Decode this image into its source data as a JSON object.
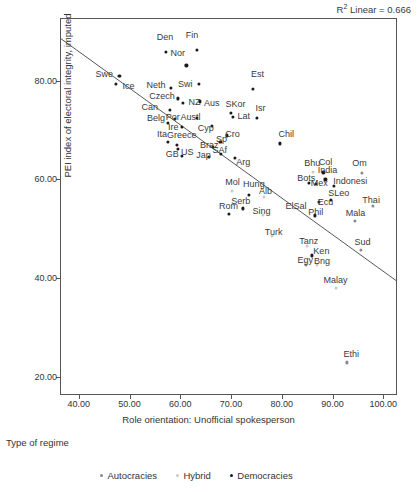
{
  "annotation": {
    "r2_prefix": "R",
    "r2_sup": "2",
    "r2_text": " Linear = 0.666"
  },
  "axes": {
    "ylabel": "PEI index of electoral integrity, imputed",
    "xlabel": "Role orientation: Unofficial spokesperson",
    "yticks": [
      "20.00",
      "40.00",
      "60.00",
      "80.00"
    ],
    "xticks": [
      "40.00",
      "50.00",
      "60.00",
      "70.00",
      "80.00",
      "90.00",
      "100.00"
    ]
  },
  "legend": {
    "title": "Type of regime",
    "items": [
      {
        "label": "Autocracies",
        "color": "#8a8a8a"
      },
      {
        "label": "Hybrid",
        "color": "#c9c9c9"
      },
      {
        "label": "Democracies",
        "color": "#1a1a1a"
      }
    ]
  },
  "chart_data": {
    "type": "scatter",
    "title": "",
    "xlabel": "Role orientation: Unofficial spokesperson",
    "ylabel": "PEI index of electoral integrity, imputed",
    "xlim": [
      36.5,
      102.5
    ],
    "ylim": [
      16.5,
      92.5
    ],
    "grid": false,
    "legend_position": "bottom",
    "r_squared": 0.666,
    "fit_line": {
      "type": "linear",
      "x": [
        36.5,
        102.5
      ],
      "y": [
        88.5,
        39.5
      ]
    },
    "series": [
      {
        "name": "Autocracies",
        "color": "#8a8a8a"
      },
      {
        "name": "Hybrid",
        "color": "#c9c9c9"
      },
      {
        "name": "Democracies",
        "color": "#1a1a1a"
      }
    ],
    "points": [
      {
        "label": "Den",
        "x": 57.2,
        "y": 85.9,
        "group": "Democracies",
        "lx": 57.0,
        "ly": 88.8
      },
      {
        "label": "Fin",
        "x": 63.2,
        "y": 86.2,
        "group": "Democracies",
        "lx": 62.3,
        "ly": 89.3
      },
      {
        "label": "Nor",
        "x": 61.2,
        "y": 83.1,
        "group": "Democracies",
        "lx": 59.5,
        "ly": 85.6
      },
      {
        "label": "Swe",
        "x": 48.0,
        "y": 81.0,
        "group": "Democracies",
        "lx": 45.0,
        "ly": 81.3
      },
      {
        "label": "Ice",
        "x": 47.3,
        "y": 79.4,
        "group": "Democracies",
        "lx": 49.8,
        "ly": 78.9
      },
      {
        "label": "Neth",
        "x": 58.2,
        "y": 78.6,
        "group": "Democracies",
        "lx": 55.2,
        "ly": 79.2
      },
      {
        "label": "Swi",
        "x": 63.6,
        "y": 79.4,
        "group": "Democracies",
        "lx": 61.0,
        "ly": 79.3
      },
      {
        "label": "Est",
        "x": 74.3,
        "y": 78.4,
        "group": "Democracies",
        "lx": 75.2,
        "ly": 81.3
      },
      {
        "label": "Czech",
        "x": 59.5,
        "y": 76.4,
        "group": "Democracies",
        "lx": 56.4,
        "ly": 76.8
      },
      {
        "label": "NZ",
        "x": 60.5,
        "y": 75.5,
        "group": "Democracies",
        "lx": 62.8,
        "ly": 75.6
      },
      {
        "label": "Aus",
        "x": 63.9,
        "y": 75.8,
        "group": "Democracies",
        "lx": 66.2,
        "ly": 75.4
      },
      {
        "label": "SKor",
        "x": 69.9,
        "y": 73.5,
        "group": "Democracies",
        "lx": 70.9,
        "ly": 75.2
      },
      {
        "label": "Can",
        "x": 58.0,
        "y": 74.1,
        "group": "Democracies",
        "lx": 54.0,
        "ly": 74.7
      },
      {
        "label": "Isr",
        "x": 75.1,
        "y": 72.4,
        "group": "Democracies",
        "lx": 75.8,
        "ly": 74.4
      },
      {
        "label": "Lat",
        "x": 70.3,
        "y": 72.6,
        "group": "Democracies",
        "lx": 72.5,
        "ly": 72.9
      },
      {
        "label": "Austl",
        "x": 63.3,
        "y": 72.4,
        "group": "Democracies",
        "lx": 62.0,
        "ly": 72.6
      },
      {
        "label": "Belg",
        "x": 57.6,
        "y": 71.5,
        "group": "Democracies",
        "lx": 55.2,
        "ly": 72.5
      },
      {
        "label": "Por",
        "x": 59.0,
        "y": 72.3,
        "group": "Democracies",
        "lx": 58.5,
        "ly": 72.7
      },
      {
        "label": "Ire",
        "x": 60.3,
        "y": 70.7,
        "group": "Democracies",
        "lx": 58.6,
        "ly": 70.6
      },
      {
        "label": "Cyp",
        "x": 66.3,
        "y": 70.8,
        "group": "Democracies",
        "lx": 65.0,
        "ly": 70.5
      },
      {
        "label": "Cro",
        "x": 69.2,
        "y": 68.9,
        "group": "Democracies",
        "lx": 70.3,
        "ly": 69.2
      },
      {
        "label": "Ita",
        "x": 57.6,
        "y": 67.6,
        "group": "Democracies",
        "lx": 56.4,
        "ly": 69.2
      },
      {
        "label": "Greece",
        "x": 59.4,
        "y": 67.0,
        "group": "Democracies",
        "lx": 60.3,
        "ly": 68.9
      },
      {
        "label": "Sp",
        "x": 67.9,
        "y": 67.6,
        "group": "Democracies",
        "lx": 68.1,
        "ly": 68.1
      },
      {
        "label": "Braz",
        "x": 66.5,
        "y": 66.5,
        "group": "Democracies",
        "lx": 65.7,
        "ly": 66.9
      },
      {
        "label": "SAf",
        "x": 68.0,
        "y": 65.2,
        "group": "Democracies",
        "lx": 67.8,
        "ly": 65.9
      },
      {
        "label": "GB",
        "x": 60.4,
        "y": 64.7,
        "group": "Democracies",
        "lx": 58.4,
        "ly": 65.2
      },
      {
        "label": "US",
        "x": 59.6,
        "y": 66.2,
        "group": "Democracies",
        "lx": 61.4,
        "ly": 65.6
      },
      {
        "label": "Jap",
        "x": 65.6,
        "y": 64.6,
        "group": "Democracies",
        "lx": 64.6,
        "ly": 64.9
      },
      {
        "label": "Arg",
        "x": 70.7,
        "y": 64.3,
        "group": "Democracies",
        "lx": 72.4,
        "ly": 63.6
      },
      {
        "label": "Chil",
        "x": 79.6,
        "y": 67.3,
        "group": "Democracies",
        "lx": 80.9,
        "ly": 69.2
      },
      {
        "label": "Bhu",
        "x": 86.2,
        "y": 61.4,
        "group": "Hybrid",
        "lx": 86.0,
        "ly": 63.4
      },
      {
        "label": "Col",
        "x": 88.2,
        "y": 61.4,
        "group": "Democracies",
        "lx": 88.6,
        "ly": 63.6
      },
      {
        "label": "Om",
        "x": 95.8,
        "y": 61.3,
        "group": "Autocracies",
        "lx": 95.3,
        "ly": 63.4
      },
      {
        "label": "India",
        "x": 88.6,
        "y": 60.0,
        "group": "Democracies",
        "lx": 89.0,
        "ly": 61.8
      },
      {
        "label": "Bots",
        "x": 85.3,
        "y": 59.3,
        "group": "Democracies",
        "lx": 84.8,
        "ly": 60.3
      },
      {
        "label": "Mex",
        "x": 86.8,
        "y": 59.1,
        "group": "Democracies",
        "lx": 87.4,
        "ly": 59.3
      },
      {
        "label": "Indonesi",
        "x": 90.3,
        "y": 58.6,
        "group": "Democracies",
        "lx": 93.5,
        "ly": 59.6
      },
      {
        "label": "Mol",
        "x": 70.2,
        "y": 57.6,
        "group": "Hybrid",
        "lx": 70.3,
        "ly": 59.4
      },
      {
        "label": "Hung",
        "x": 73.6,
        "y": 56.9,
        "group": "Democracies",
        "lx": 74.5,
        "ly": 59.1
      },
      {
        "label": "Alb",
        "x": 76.4,
        "y": 56.4,
        "group": "Hybrid",
        "lx": 76.8,
        "ly": 57.7
      },
      {
        "label": "SLeo",
        "x": 89.7,
        "y": 55.8,
        "group": "Democracies",
        "lx": 91.2,
        "ly": 57.3
      },
      {
        "label": "Ecu",
        "x": 87.3,
        "y": 55.5,
        "group": "Democracies",
        "lx": 88.6,
        "ly": 55.5
      },
      {
        "label": "Serb",
        "x": 72.3,
        "y": 54.1,
        "group": "Democracies",
        "lx": 71.9,
        "ly": 55.6
      },
      {
        "label": "Rom",
        "x": 69.5,
        "y": 53.0,
        "group": "Democracies",
        "lx": 69.5,
        "ly": 54.6
      },
      {
        "label": "ElSal",
        "x": 82.5,
        "y": 54.2,
        "group": "Hybrid",
        "lx": 82.8,
        "ly": 54.7
      },
      {
        "label": "Sing",
        "x": 76.2,
        "y": 52.8,
        "group": "Hybrid",
        "lx": 76.0,
        "ly": 53.6
      },
      {
        "label": "Phil",
        "x": 86.6,
        "y": 52.7,
        "group": "Democracies",
        "lx": 86.7,
        "ly": 53.3
      },
      {
        "label": "Thai",
        "x": 98.0,
        "y": 54.6,
        "group": "Autocracies",
        "lx": 97.6,
        "ly": 55.9
      },
      {
        "label": "Mala",
        "x": 94.4,
        "y": 51.6,
        "group": "Autocracies",
        "lx": 94.5,
        "ly": 53.2
      },
      {
        "label": "Turk",
        "x": 78.0,
        "y": 48.5,
        "group": "Hybrid",
        "lx": 78.4,
        "ly": 49.3
      },
      {
        "label": "Tanz",
        "x": 85.0,
        "y": 46.5,
        "group": "Hybrid",
        "lx": 85.3,
        "ly": 47.5
      },
      {
        "label": "Sud",
        "x": 95.6,
        "y": 45.7,
        "group": "Autocracies",
        "lx": 95.9,
        "ly": 47.3
      },
      {
        "label": "Ken",
        "x": 85.9,
        "y": 44.6,
        "group": "Democracies",
        "lx": 87.8,
        "ly": 45.4
      },
      {
        "label": "Egy",
        "x": 84.7,
        "y": 42.6,
        "group": "Autocracies",
        "lx": 84.6,
        "ly": 43.6
      },
      {
        "label": "Bng",
        "x": 87.0,
        "y": 42.6,
        "group": "Hybrid",
        "lx": 87.9,
        "ly": 43.4
      },
      {
        "label": "Malay",
        "x": 90.7,
        "y": 38.0,
        "group": "Hybrid",
        "lx": 90.6,
        "ly": 39.7
      },
      {
        "label": "Ethi",
        "x": 92.9,
        "y": 22.9,
        "group": "Autocracies",
        "lx": 93.7,
        "ly": 24.6
      }
    ]
  }
}
